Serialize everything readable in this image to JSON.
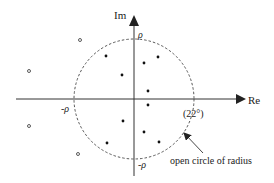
{
  "diagram": {
    "axes": {
      "x_label": "Re",
      "y_label": "Im",
      "origin": [
        134,
        99
      ]
    },
    "circle": {
      "center": [
        134,
        99
      ],
      "radius": 60,
      "style": "dashed",
      "labels": {
        "top": "ρ",
        "bottom": "-ρ",
        "left": "-ρ",
        "right": "(22°)"
      }
    },
    "filled_points": [
      [
        106,
        56
      ],
      [
        158,
        57
      ],
      [
        144,
        63
      ],
      [
        122,
        75
      ],
      [
        148,
        91
      ],
      [
        148,
        105
      ],
      [
        123,
        121
      ],
      [
        144,
        132
      ],
      [
        159,
        142
      ],
      [
        107,
        143
      ]
    ],
    "open_points": [
      [
        80,
        40
      ],
      [
        29,
        71
      ],
      [
        29,
        126
      ],
      [
        78,
        154
      ]
    ],
    "annotation": {
      "text": "open circle of radius",
      "color": "#222222"
    }
  }
}
